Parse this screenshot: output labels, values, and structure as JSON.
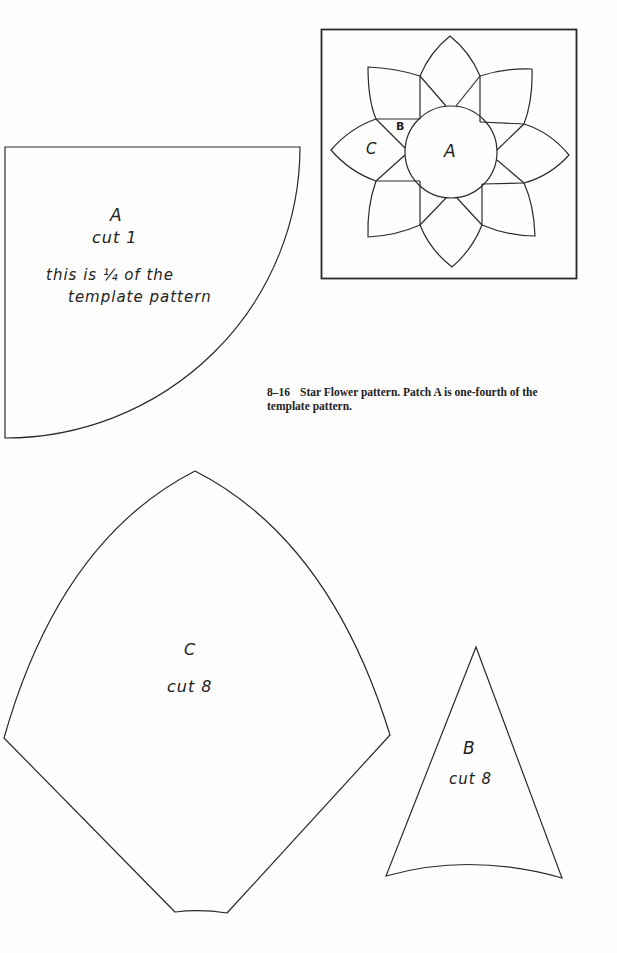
{
  "figure": {
    "number": "8–16",
    "caption": "Star Flower pattern. Patch A is one-fourth of the template pattern."
  },
  "block_diagram": {
    "labels": {
      "center": "A",
      "small": "B",
      "petal": "C"
    }
  },
  "patches": {
    "A": {
      "letter": "A",
      "instruction": "cut 1",
      "note_line1": "this is ¼ of the",
      "note_line2": "template pattern"
    },
    "B": {
      "letter": "B",
      "instruction": "cut 8"
    },
    "C": {
      "letter": "C",
      "instruction": "cut 8"
    }
  },
  "colors": {
    "line": "#2a2a2a",
    "background": "#fefefe"
  }
}
